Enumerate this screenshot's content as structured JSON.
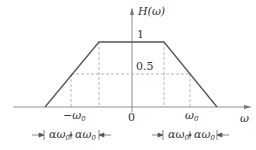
{
  "figure": {
    "y_label": "H(ω)",
    "x_label": "ω",
    "origin_label": "0",
    "level_top": "1",
    "level_half": "0.5",
    "tick_neg": "−ω",
    "tick_neg_sub": "0",
    "tick_pos": "ω",
    "tick_pos_sub": "0",
    "width_left_a": "αω",
    "width_left_a_sub": "0",
    "width_left_b": "αω",
    "width_left_b_sub": "0",
    "width_right_a": "αω",
    "width_right_a_sub": "0",
    "width_right_b": "αω",
    "width_right_b_sub": "0"
  },
  "colors": {
    "line": "#555555",
    "dash": "#999999",
    "axis": "#666666"
  }
}
